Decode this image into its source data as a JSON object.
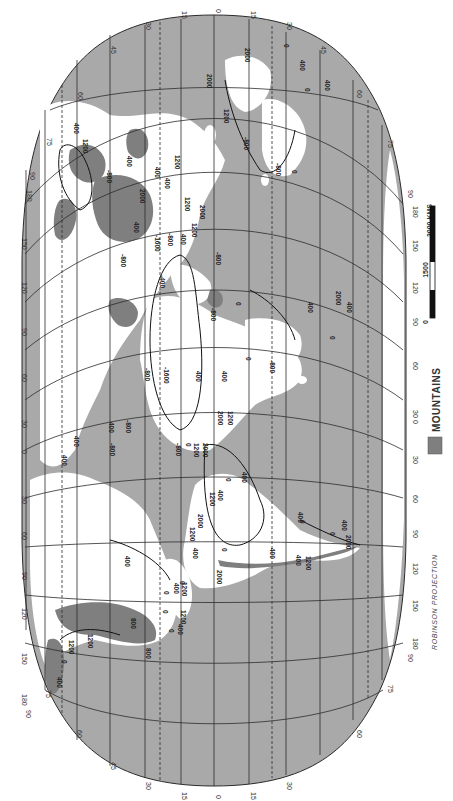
{
  "map": {
    "projection_label": "ROBINSON PROJECTION",
    "orientation": "rotated 90 degrees clockwise",
    "colors": {
      "ocean": "#a9a9a9",
      "land": "#ffffff",
      "mountains": "#7f7f7f",
      "grid": "#2b2b2b",
      "background": "#ffffff"
    },
    "latitude_labels": [
      "90",
      "75",
      "60",
      "45",
      "30",
      "15",
      "0",
      "15",
      "30",
      "45",
      "60",
      "75",
      "90"
    ],
    "longitude_labels": [
      "180",
      "150",
      "120",
      "90",
      "60",
      "30",
      "0",
      "30",
      "60",
      "90",
      "120",
      "150",
      "180"
    ],
    "tropic_lines": "dashed",
    "left_side_labels": {
      "top": [
        "75",
        "180",
        "90",
        "150",
        "120"
      ],
      "middle": [
        "90",
        "60",
        "30",
        "0",
        "30"
      ],
      "bottom": [
        "60",
        "90",
        "120",
        "150",
        "180",
        "90"
      ]
    },
    "right_side_labels": {
      "top": [
        "75",
        "90",
        "180",
        "150",
        "120"
      ],
      "middle": [
        "90",
        "60",
        "30",
        "0",
        "30"
      ],
      "bottom": [
        "60",
        "90",
        "120",
        "150",
        "180",
        "90"
      ]
    },
    "top_edge_labels": [
      "60",
      "45",
      "30",
      "15",
      "0",
      "15",
      "30",
      "45",
      "60"
    ],
    "bottom_edge_labels": [
      "75",
      "60",
      "45",
      "30",
      "15",
      "0",
      "15",
      "30",
      "60",
      "75"
    ]
  },
  "legend": {
    "label": "MOUNTAINS",
    "swatch_color": "#7f7f7f"
  },
  "scale_bar": {
    "unit_label": "3000 KMS",
    "ticks": [
      "0",
      "1500",
      "3000 KMS"
    ],
    "mid_label": "1500",
    "zero_label": "0"
  },
  "contour_labels": [
    {
      "text": "2000",
      "x": 245,
      "y": 48
    },
    {
      "text": "0",
      "x": 284,
      "y": 44
    },
    {
      "text": "400",
      "x": 300,
      "y": 60
    },
    {
      "text": "400",
      "x": 325,
      "y": 80
    },
    {
      "text": "0",
      "x": 305,
      "y": 88
    },
    {
      "text": "2000",
      "x": 207,
      "y": 74
    },
    {
      "text": "1200",
      "x": 224,
      "y": 109
    },
    {
      "text": "-800",
      "x": 244,
      "y": 137
    },
    {
      "text": "-800",
      "x": 276,
      "y": 163
    },
    {
      "text": "0",
      "x": 292,
      "y": 170
    },
    {
      "text": "1200",
      "x": 83,
      "y": 139
    },
    {
      "text": "400",
      "x": 74,
      "y": 123
    },
    {
      "text": "400",
      "x": 127,
      "y": 156
    },
    {
      "text": "-800",
      "x": 107,
      "y": 170
    },
    {
      "text": "2000",
      "x": 140,
      "y": 189
    },
    {
      "text": "400",
      "x": 134,
      "y": 222
    },
    {
      "text": "-800",
      "x": 121,
      "y": 254
    },
    {
      "text": "400",
      "x": 155,
      "y": 167
    },
    {
      "text": "1200",
      "x": 175,
      "y": 155
    },
    {
      "text": "400",
      "x": 165,
      "y": 178
    },
    {
      "text": "1200",
      "x": 185,
      "y": 197
    },
    {
      "text": "2000",
      "x": 200,
      "y": 205
    },
    {
      "text": "1200",
      "x": 192,
      "y": 223
    },
    {
      "text": "400",
      "x": 181,
      "y": 234
    },
    {
      "text": "-1600",
      "x": 155,
      "y": 235
    },
    {
      "text": "-800",
      "x": 168,
      "y": 233
    },
    {
      "text": "-400",
      "x": 160,
      "y": 275
    },
    {
      "text": "-800",
      "x": 216,
      "y": 252
    },
    {
      "text": "-800",
      "x": 211,
      "y": 308
    },
    {
      "text": "0",
      "x": 236,
      "y": 302
    },
    {
      "text": "400",
      "x": 308,
      "y": 302
    },
    {
      "text": "2000",
      "x": 336,
      "y": 291
    },
    {
      "text": "400",
      "x": 347,
      "y": 302
    },
    {
      "text": "0",
      "x": 330,
      "y": 336
    },
    {
      "text": "-800",
      "x": 270,
      "y": 360
    },
    {
      "text": "400",
      "x": 222,
      "y": 371
    },
    {
      "text": "0",
      "x": 246,
      "y": 357
    },
    {
      "text": "-1600",
      "x": 164,
      "y": 367
    },
    {
      "text": "400",
      "x": 196,
      "y": 371
    },
    {
      "text": "-800",
      "x": 145,
      "y": 368
    },
    {
      "text": "2000",
      "x": 218,
      "y": 411
    },
    {
      "text": "1200",
      "x": 228,
      "y": 411
    },
    {
      "text": "-800",
      "x": 176,
      "y": 443
    },
    {
      "text": "0",
      "x": 186,
      "y": 443
    },
    {
      "text": "1200",
      "x": 194,
      "y": 443
    },
    {
      "text": "2000",
      "x": 203,
      "y": 443
    },
    {
      "text": "400",
      "x": 109,
      "y": 422
    },
    {
      "text": "-800",
      "x": 126,
      "y": 420
    },
    {
      "text": "400",
      "x": 74,
      "y": 436
    },
    {
      "text": "400",
      "x": 62,
      "y": 455
    },
    {
      "text": "-800",
      "x": 110,
      "y": 443
    },
    {
      "text": "400",
      "x": 242,
      "y": 472
    },
    {
      "text": "0",
      "x": 226,
      "y": 478
    },
    {
      "text": "1200",
      "x": 210,
      "y": 492
    },
    {
      "text": "400",
      "x": 218,
      "y": 490
    },
    {
      "text": "2000",
      "x": 198,
      "y": 514
    },
    {
      "text": "1200",
      "x": 190,
      "y": 527
    },
    {
      "text": "400",
      "x": 193,
      "y": 548
    },
    {
      "text": "0",
      "x": 222,
      "y": 548
    },
    {
      "text": "2000",
      "x": 217,
      "y": 570
    },
    {
      "text": "0",
      "x": 180,
      "y": 581
    },
    {
      "text": "400",
      "x": 298,
      "y": 512
    },
    {
      "text": "0",
      "x": 300,
      "y": 520
    },
    {
      "text": "400",
      "x": 270,
      "y": 548
    },
    {
      "text": "400",
      "x": 342,
      "y": 520
    },
    {
      "text": "0",
      "x": 330,
      "y": 532
    },
    {
      "text": "2000",
      "x": 346,
      "y": 535
    },
    {
      "text": "400",
      "x": 296,
      "y": 555
    },
    {
      "text": "1200",
      "x": 306,
      "y": 556
    },
    {
      "text": "400",
      "x": 125,
      "y": 556
    },
    {
      "text": "0",
      "x": 164,
      "y": 591
    },
    {
      "text": "400",
      "x": 174,
      "y": 583
    },
    {
      "text": "1200",
      "x": 182,
      "y": 582
    },
    {
      "text": "1200",
      "x": 181,
      "y": 610
    },
    {
      "text": "0",
      "x": 163,
      "y": 610
    },
    {
      "text": "400",
      "x": 178,
      "y": 624
    },
    {
      "text": "0",
      "x": 169,
      "y": 629
    },
    {
      "text": "800",
      "x": 131,
      "y": 618
    },
    {
      "text": "1200",
      "x": 88,
      "y": 634
    },
    {
      "text": "1200",
      "x": 69,
      "y": 640
    },
    {
      "text": "800",
      "x": 146,
      "y": 648
    },
    {
      "text": "400",
      "x": 57,
      "y": 677
    },
    {
      "text": "0",
      "x": 62,
      "y": 660
    }
  ]
}
